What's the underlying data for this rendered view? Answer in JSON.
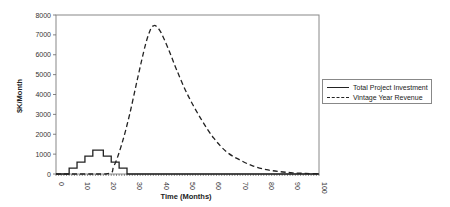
{
  "chart_data": {
    "type": "line",
    "title": "",
    "xlabel": "Time (Months)",
    "ylabel": "$K/Month",
    "xlim": [
      0,
      100
    ],
    "ylim": [
      0,
      8000
    ],
    "x_ticks": [
      0,
      10,
      20,
      30,
      40,
      50,
      60,
      70,
      80,
      90,
      100
    ],
    "y_ticks": [
      0,
      1000,
      2000,
      3000,
      4000,
      5000,
      6000,
      7000,
      8000
    ],
    "grid": false,
    "legend_position": "right",
    "series": [
      {
        "name": "Total Project Investment",
        "style": "solid",
        "color": "#222222",
        "x": [
          0,
          5,
          5,
          8,
          8,
          11,
          11,
          14,
          14,
          18,
          18,
          21,
          21,
          24,
          24,
          27,
          27,
          100
        ],
        "values": [
          0,
          0,
          300,
          300,
          600,
          600,
          900,
          900,
          1200,
          1200,
          900,
          900,
          600,
          600,
          300,
          300,
          0,
          0
        ]
      },
      {
        "name": "Vintage Year Revenue",
        "style": "dashed",
        "color": "#222222",
        "x": [
          0,
          19,
          22,
          25,
          28,
          31,
          34,
          36,
          37,
          38,
          40,
          43,
          46,
          50,
          55,
          60,
          65,
          70,
          75,
          80,
          85,
          90,
          95,
          100
        ],
        "values": [
          0,
          0,
          400,
          1500,
          3000,
          4800,
          6500,
          7300,
          7450,
          7450,
          7100,
          6200,
          5200,
          4000,
          2800,
          1800,
          1100,
          700,
          400,
          220,
          120,
          60,
          30,
          10
        ]
      }
    ]
  },
  "axes": {
    "xlabel": "Time (Months)",
    "ylabel": "$K/Month",
    "x_ticks": [
      "0",
      "10",
      "20",
      "30",
      "40",
      "50",
      "60",
      "70",
      "80",
      "90",
      "100"
    ],
    "y_ticks": [
      "0",
      "1000",
      "2000",
      "3000",
      "4000",
      "5000",
      "6000",
      "7000",
      "8000"
    ]
  },
  "legend": {
    "items": [
      {
        "label": "Total Project Investment",
        "style": "solid"
      },
      {
        "label": "Vintage Year Revenue",
        "style": "dashed"
      }
    ]
  }
}
